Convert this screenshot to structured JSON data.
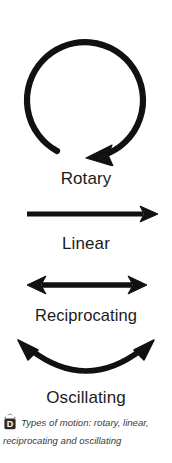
{
  "figure": {
    "background_color": "#ffffff",
    "stroke_color": "#111111",
    "label_color": "#1b1b1b"
  },
  "motions": [
    {
      "key": "rotary",
      "label": "Rotary",
      "icon": "circular-arrow-icon",
      "description": "Near-full circle with arrowhead at bottom right pointing counter-clockwise"
    },
    {
      "key": "linear",
      "label": "Linear",
      "icon": "single-arrow-right-icon",
      "description": "Straight horizontal arrow pointing right"
    },
    {
      "key": "reciprocating",
      "label": "Reciprocating",
      "icon": "double-headed-arrow-icon",
      "description": "Straight horizontal arrow with arrowheads at both ends"
    },
    {
      "key": "oscillating",
      "label": "Oscillating",
      "icon": "curved-double-arrow-icon",
      "description": "Concave-up arc with arrowheads at both upper ends"
    }
  ],
  "caption": {
    "badge_letter": "D",
    "badge_name": "design-technology-badge",
    "text": "Types of motion: rotary, linear, reciprocating and oscillating",
    "text_color": "#3a3a3a"
  }
}
